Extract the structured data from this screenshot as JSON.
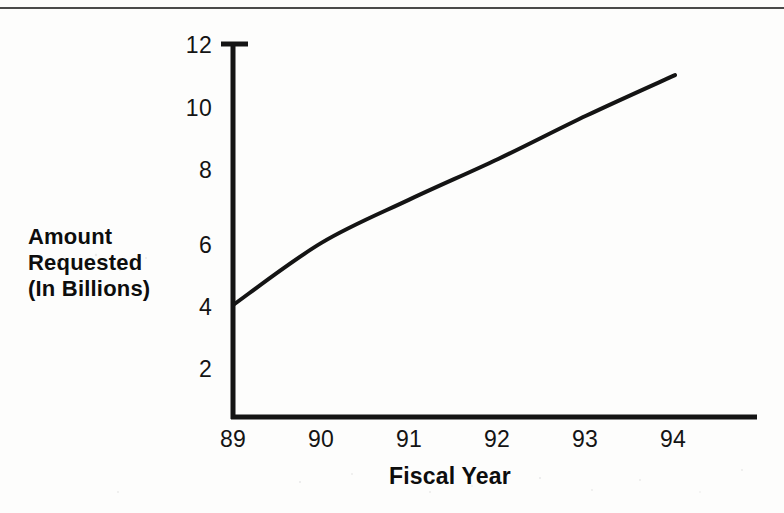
{
  "page": {
    "background_color": "#fdfdfc",
    "ink_color": "#141414",
    "top_rule_color": "#4a4a4a"
  },
  "chart_data": {
    "type": "line",
    "title": "",
    "xlabel": "Fiscal Year",
    "ylabel": "Amount Requested (In Billions)",
    "ylabel_lines": [
      "Amount",
      "Requested",
      "(In Billions)"
    ],
    "categories": [
      "89",
      "90",
      "91",
      "92",
      "93",
      "94"
    ],
    "x": [
      89,
      90,
      91,
      92,
      93,
      94
    ],
    "values": [
      3.6,
      5.6,
      7.0,
      8.3,
      9.7,
      11.0
    ],
    "series": [
      {
        "name": "Amount Requested",
        "values": [
          3.6,
          5.6,
          7.0,
          8.3,
          9.7,
          11.0
        ],
        "color": "#141414",
        "line_width": 4
      }
    ],
    "yticks": [
      2,
      4,
      6,
      8,
      10,
      12
    ],
    "ytick_labels": [
      "2",
      "4",
      "6",
      "8",
      "10",
      "12"
    ],
    "xtick_labels": [
      "89",
      "90",
      "91",
      "92",
      "93",
      "94"
    ],
    "ylim": [
      0,
      12
    ],
    "xlim": [
      89,
      94
    ],
    "grid": false,
    "legend": null,
    "units": "Billions of dollars",
    "markers": false,
    "axis_style": {
      "y_axis_top_tick": true,
      "spines": [
        "left",
        "bottom"
      ]
    }
  },
  "axis": {
    "y_title_line_1": "Amount",
    "y_title_line_2": "Requested",
    "y_title_line_3": "(In Billions)",
    "x_title": "Fiscal Year",
    "y_tick_12": "12",
    "y_tick_10": "10",
    "y_tick_8": "8",
    "y_tick_6": "6",
    "y_tick_4": "4",
    "y_tick_2": "2",
    "x_tick_89": "89",
    "x_tick_90": "90",
    "x_tick_91": "91",
    "x_tick_92": "92",
    "x_tick_93": "93",
    "x_tick_94": "94"
  }
}
